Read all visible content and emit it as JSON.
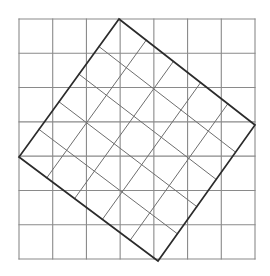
{
  "figure": {
    "canvas": {
      "width": 270,
      "height": 276,
      "background": "#ffffff"
    }
  },
  "background_grid": {
    "name": "background-grid",
    "rows": 7,
    "columns": 7,
    "x_start": 19,
    "y_start": 19,
    "x_end": 255,
    "y_end": 259,
    "cell_width": 33.71,
    "cell_height": 34.29,
    "line_color": "#8a8a8a",
    "line_width": 1.1,
    "x_lines": [
      19,
      52.71,
      86.43,
      120.14,
      153.86,
      187.57,
      221.29,
      255
    ],
    "y_lines": [
      19,
      53.29,
      87.57,
      121.86,
      156.14,
      190.43,
      224.71,
      259
    ]
  },
  "tilted_square": {
    "name": "tilted-square",
    "vertices": [
      {
        "label": "top",
        "x": 119,
        "y": 19
      },
      {
        "label": "right",
        "x": 255,
        "y": 125
      },
      {
        "label": "bottom",
        "x": 158,
        "y": 261
      },
      {
        "label": "left",
        "x": 19,
        "y": 157
      }
    ],
    "side_length": 172.4,
    "rotation_degrees": 37.9,
    "outline_color": "#2b2b2b",
    "outline_width": 1.7,
    "subdivisions": 5,
    "inner_line_color": "#6e6e6e",
    "inner_line_width": 1.0
  },
  "chart_data": {
    "type": "diagram",
    "xlabel": "",
    "ylabel": "",
    "xlim": [
      0,
      270
    ],
    "ylim": [
      0,
      276
    ],
    "grid": true,
    "legend": "none",
    "series": [
      {
        "name": "background-grid",
        "kind": "grid",
        "rows": 7,
        "columns": 7,
        "x_lines": [
          19,
          52.71,
          86.43,
          120.14,
          153.86,
          187.57,
          221.29,
          255
        ],
        "y_lines": [
          19,
          53.29,
          87.57,
          121.86,
          156.14,
          190.43,
          224.71,
          259
        ],
        "color": "#8a8a8a"
      },
      {
        "name": "tilted-square-outline",
        "kind": "polygon",
        "points": [
          [
            119,
            19
          ],
          [
            255,
            125
          ],
          [
            158,
            261
          ],
          [
            19,
            157
          ]
        ],
        "closed": true,
        "color": "#2b2b2b"
      },
      {
        "name": "tilted-square-inner-grid",
        "kind": "grid",
        "rows": 5,
        "columns": 5,
        "color": "#6e6e6e",
        "note": "lines drawn parallel to the two pairs of square edges, dividing each edge into five equal parts"
      }
    ]
  }
}
